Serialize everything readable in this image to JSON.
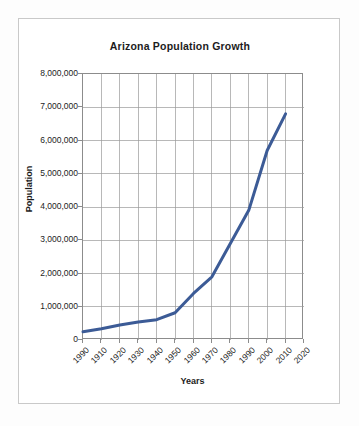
{
  "chart_data": {
    "type": "line",
    "title": "Arizona Population Growth",
    "xlabel": "Years",
    "ylabel": "Population",
    "categories": [
      "1990",
      "1910",
      "1920",
      "1930",
      "1940",
      "1950",
      "1960",
      "1970",
      "1980",
      "1990",
      "2000",
      "2010",
      "2020"
    ],
    "x_tick_labels": [
      "1990",
      "1910",
      "1920",
      "1930",
      "1940",
      "1950",
      "1960",
      "1970",
      "1980",
      "1990",
      "2000",
      "2010",
      "2020"
    ],
    "y_tick_labels": [
      "8,000,000",
      "7,000,000",
      "6,000,000",
      "5,000,000",
      "4,000,000",
      "3,000,000",
      "2,000,000",
      "1,000,000",
      "0"
    ],
    "y_tick_values": [
      8000000,
      7000000,
      6000000,
      5000000,
      4000000,
      3000000,
      2000000,
      1000000,
      0
    ],
    "ylim": [
      0,
      8000000
    ],
    "xlim": [
      0,
      12
    ],
    "grid": true,
    "legend": false,
    "legend_position": "none",
    "series": [
      {
        "name": "Arizona Population",
        "color": "#3c5b96",
        "line_width": 3,
        "x": [
          0,
          1,
          2,
          3,
          4,
          5,
          6,
          7,
          8,
          9,
          10,
          11
        ],
        "values": [
          250000,
          340000,
          450000,
          540000,
          610000,
          820000,
          1400000,
          1900000,
          2900000,
          3900000,
          5700000,
          6800000
        ]
      }
    ]
  },
  "figure": {
    "title": "Arizona Population Growth",
    "x_axis_title": "Years",
    "y_axis_title": "Population"
  },
  "colors": {
    "series_blue": "#3c5b96",
    "gridline": "#9a9a9a",
    "axis": "#8c8c8c",
    "text": "#1c1c1c",
    "card_background": "#ffffff",
    "page_background": "#fdfdfd",
    "card_border": "#c9c9c9"
  }
}
